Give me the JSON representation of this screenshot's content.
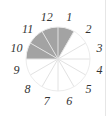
{
  "diagram": {
    "type": "fraction-circle",
    "total_sectors": 12,
    "shaded_sectors": [
      10,
      11,
      12,
      1
    ],
    "shaded_count": 4,
    "labels": [
      "1",
      "2",
      "3",
      "4",
      "5",
      "6",
      "7",
      "8",
      "9",
      "10",
      "11",
      "12"
    ],
    "colors": {
      "shaded": "#a3a3a3",
      "unshaded": "#ffffff",
      "spoke": "#e2e2e2",
      "outline": "#ececec",
      "label": "#333333"
    }
  }
}
